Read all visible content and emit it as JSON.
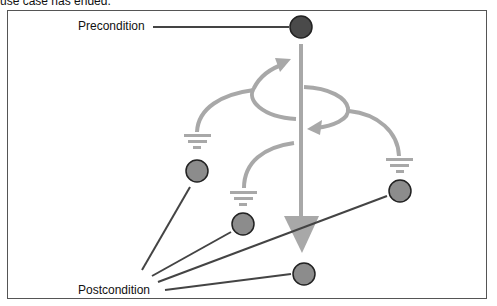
{
  "caption": "use case has ended.",
  "labels": {
    "precondition": "Precondition",
    "postcondition": "Postcondition"
  },
  "colors": {
    "frame": "#555555",
    "flow": "#a8a8a8",
    "start_node": "#4a4a4a",
    "end_node": "#8c8c8c",
    "node_outline": "#222222",
    "leader_line": "#444444"
  },
  "nodes": {
    "start": {
      "name": "precondition-node",
      "cx": 301,
      "cy": 27,
      "r": 11
    },
    "ends": [
      {
        "name": "alt-flow-left-end",
        "cx": 197,
        "cy": 171,
        "r": 11
      },
      {
        "name": "alt-flow-middle-end",
        "cx": 243,
        "cy": 224,
        "r": 11
      },
      {
        "name": "alt-flow-right-end",
        "cx": 400,
        "cy": 191,
        "r": 11
      },
      {
        "name": "basic-flow-end",
        "cx": 304,
        "cy": 274,
        "r": 11
      }
    ]
  }
}
